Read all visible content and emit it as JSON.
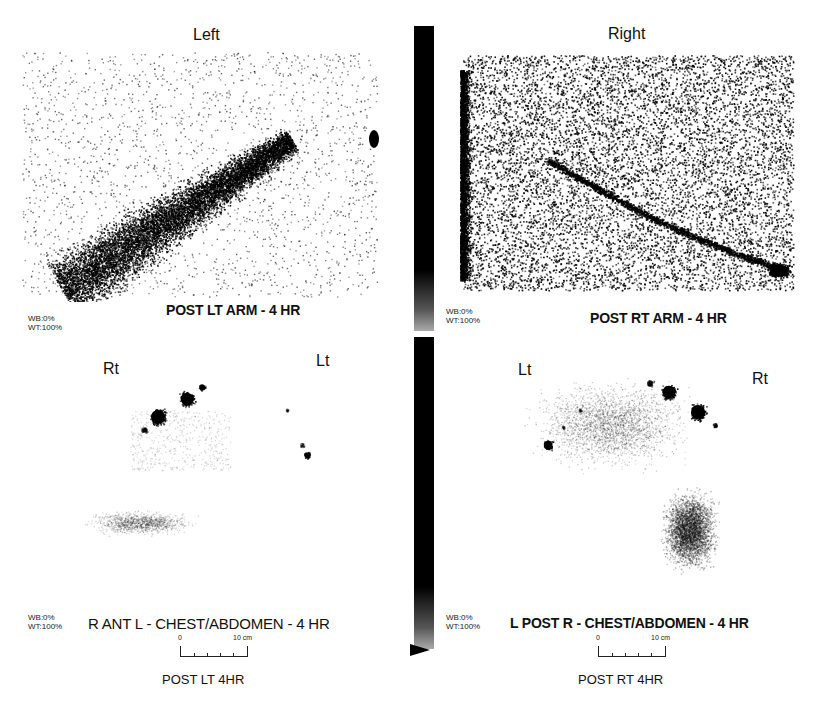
{
  "panels": {
    "top_left": {
      "title": "Left",
      "caption": "POST LT ARM - 4 HR",
      "wb": "WB:0%",
      "wt": "WT:100%"
    },
    "top_right": {
      "title": "Right",
      "caption": "POST RT ARM - 4 HR",
      "wb": "WB:0%",
      "wt": "WT:100%"
    },
    "bottom_left": {
      "side_left": "Rt",
      "side_right": "Lt",
      "caption": "R ANT L - CHEST/ABDOMEN - 4 HR",
      "wb": "WB:0%",
      "wt": "WT:100%",
      "scale_start": "0",
      "scale_end": "10 cm",
      "subtitle": "POST LT 4HR"
    },
    "bottom_right": {
      "side_left": "Lt",
      "side_right": "Rt",
      "caption": "L POST R - CHEST/ABDOMEN - 4 HR",
      "wb": "WB:0%",
      "wt": "WT:100%",
      "scale_start": "0",
      "scale_end": "10 cm",
      "subtitle": "POST RT 4HR"
    }
  },
  "color_bar": {
    "top_color": "#000000",
    "bottom_color": "#aaaaaa",
    "marker": "triangle-pointer"
  }
}
